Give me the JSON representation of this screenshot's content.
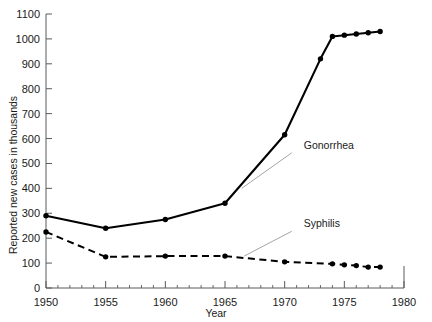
{
  "chart_data": {
    "type": "line",
    "title": "",
    "xlabel": "Year",
    "ylabel": "Reported new cases in thousands",
    "xlim": [
      1950,
      1980
    ],
    "ylim": [
      0,
      1100
    ],
    "xticks": [
      1950,
      1955,
      1960,
      1965,
      1970,
      1975,
      1980
    ],
    "xtick_labels": [
      "1950",
      "1955",
      "1960",
      "1965",
      "1970",
      "1975",
      "1980"
    ],
    "x_minor_tick_step": 1,
    "yticks": [
      0,
      100,
      200,
      300,
      400,
      500,
      600,
      700,
      800,
      900,
      1000,
      1100
    ],
    "ytick_labels": [
      "0",
      "100",
      "200",
      "300",
      "400",
      "500",
      "600",
      "700",
      "800",
      "900",
      "1000",
      "1100"
    ],
    "grid": false,
    "legend_position": "inline-annotation",
    "series": [
      {
        "name": "Gonorrhea",
        "style": "solid",
        "marker": "filled-circle",
        "label_x": 1971.6,
        "label_y": 560,
        "leader_from_x": 1970.6,
        "leader_from_y": 543,
        "leader_to_x": 1966.4,
        "leader_to_y": 400,
        "x": [
          1950,
          1955,
          1960,
          1965,
          1970,
          1973,
          1974,
          1975,
          1976,
          1977,
          1978
        ],
        "values": [
          290,
          240,
          275,
          340,
          615,
          920,
          1010,
          1015,
          1020,
          1025,
          1030
        ]
      },
      {
        "name": "Syphilis",
        "style": "dashed",
        "marker": "filled-circle",
        "label_x": 1971.6,
        "label_y": 245,
        "leader_from_x": 1970.6,
        "leader_from_y": 228,
        "leader_to_x": 1966.6,
        "leader_to_y": 128,
        "x": [
          1950,
          1955,
          1960,
          1965,
          1970,
          1974,
          1975,
          1976,
          1977,
          1978
        ],
        "values": [
          225,
          125,
          128,
          128,
          105,
          97,
          93,
          90,
          84,
          84
        ]
      }
    ]
  }
}
